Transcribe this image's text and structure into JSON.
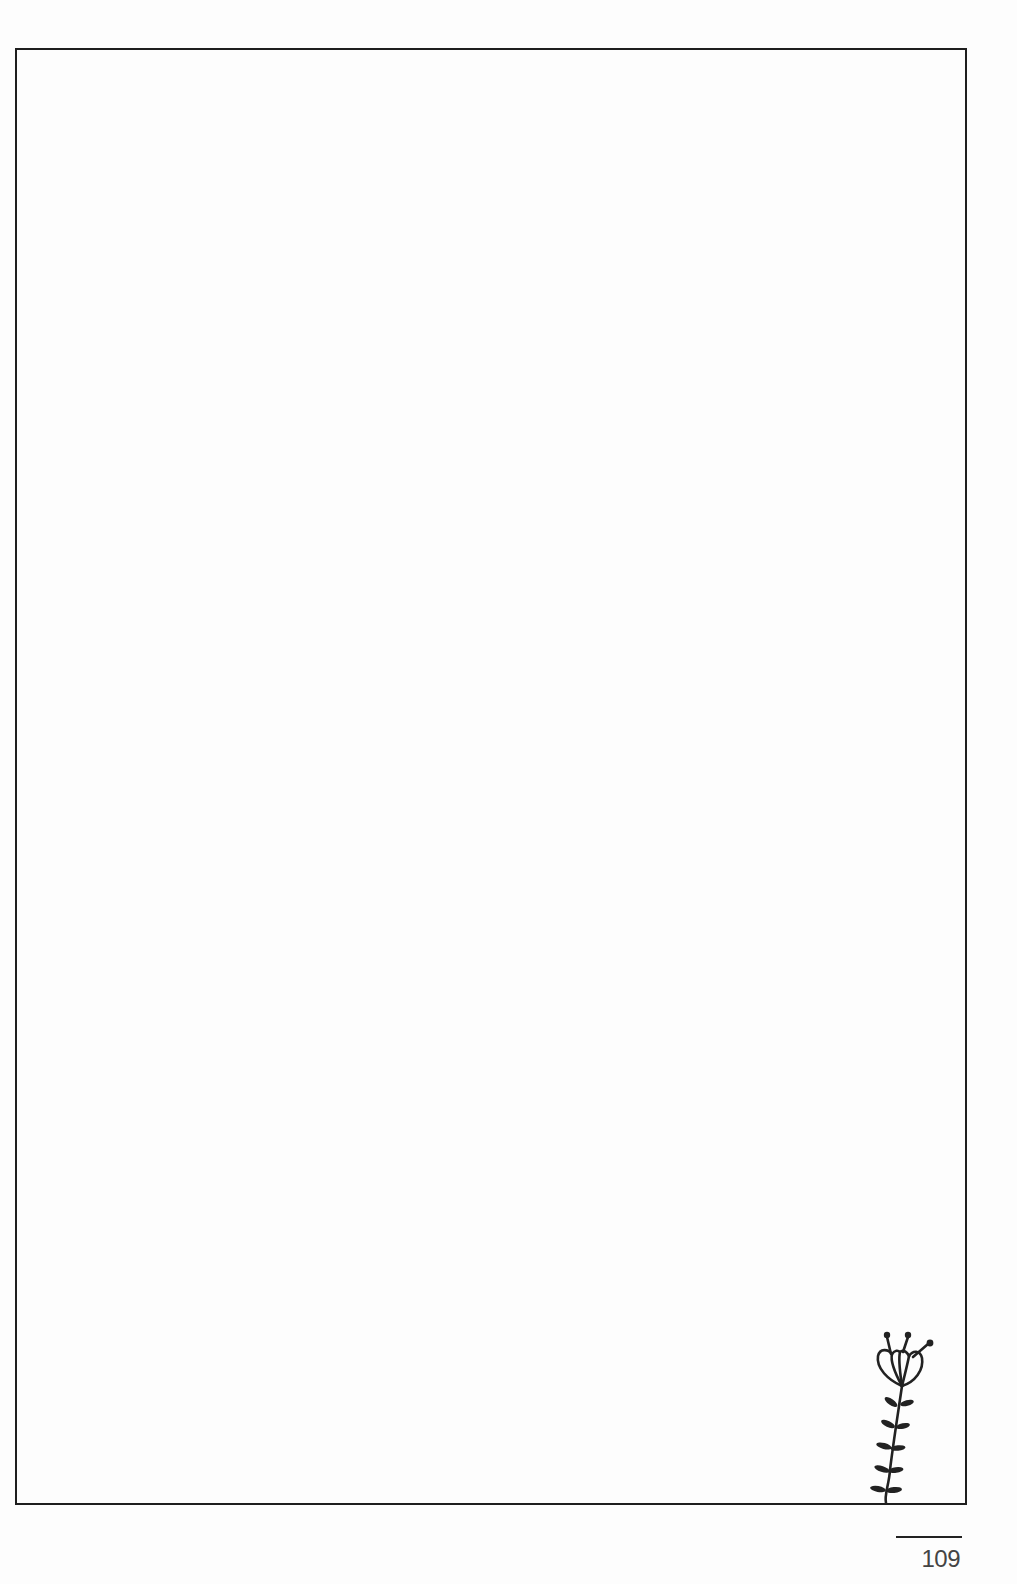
{
  "page": {
    "type": "blank journal page",
    "border_color": "#1e1e1e",
    "background": "#fdfdfd"
  },
  "decoration": {
    "icon": "flower-sprig-icon",
    "color": "#222222"
  },
  "footer": {
    "page_number": "109"
  }
}
